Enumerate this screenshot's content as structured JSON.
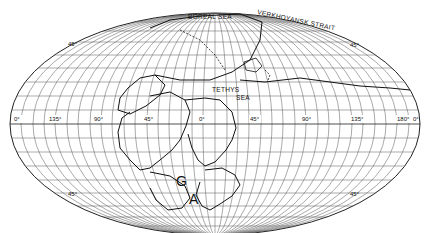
{
  "map": {
    "projection": "Mollweide-style elliptical world projection",
    "colors": {
      "line": "#222222",
      "grid": "#555555",
      "background": "#ffffff"
    },
    "region_labels": {
      "boreal_sea": "BOREAL SEA",
      "verkhoyansk_strait": "VERKHOYANSK STRAIT",
      "tethys": "TETHYS",
      "tethys_sea": "SEA",
      "g": "G",
      "a": "A"
    },
    "latitude_labels": {
      "nw": "45°",
      "ne": "45°",
      "sw": "45°",
      "se": "45°"
    },
    "equator_labels": [
      "0°",
      "135°",
      "90°",
      "45°",
      "0°",
      "45°",
      "90°",
      "135°",
      "180°",
      "0°"
    ]
  }
}
